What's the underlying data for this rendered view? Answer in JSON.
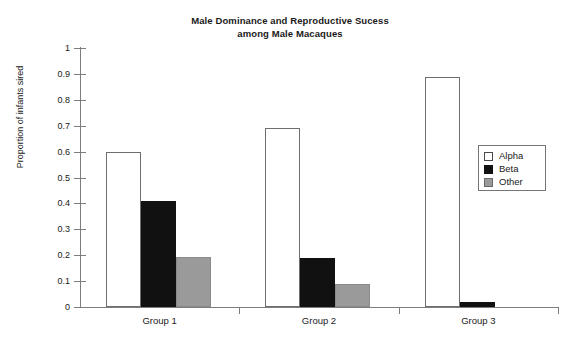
{
  "chart_data": {
    "type": "bar",
    "title": "Male Dominance and Reproductive Sucess among Male Macaques",
    "title_line1": "Male Dominance and Reproductive Sucess",
    "title_line2": "among Male Macaques",
    "xlabel": "",
    "ylabel": "Proportion of infants sired",
    "ylim": [
      0,
      1
    ],
    "ytick_labels": [
      "1",
      "0.9",
      "0.8",
      "0.7",
      "0.6",
      "0.5",
      "0.4",
      "0.3",
      "0.2",
      "0.1",
      "0"
    ],
    "ytick_values": [
      1,
      0.9,
      0.8,
      0.7,
      0.6,
      0.5,
      0.4,
      0.3,
      0.2,
      0.1,
      0
    ],
    "grid": false,
    "legend_position": "right",
    "categories": [
      "Group 1",
      "Group 2",
      "Group 3"
    ],
    "series": [
      {
        "name": "Alpha",
        "color": "#ffffff",
        "values": [
          0.6,
          0.69,
          0.89
        ]
      },
      {
        "name": "Beta",
        "color": "#111111",
        "values": [
          0.41,
          0.19,
          0.02
        ]
      },
      {
        "name": "Other",
        "color": "#9a9a9a",
        "values": [
          0.195,
          0.09,
          0
        ]
      }
    ]
  },
  "legend": {
    "items": [
      {
        "label": "Alpha"
      },
      {
        "label": "Beta"
      },
      {
        "label": "Other"
      }
    ]
  }
}
